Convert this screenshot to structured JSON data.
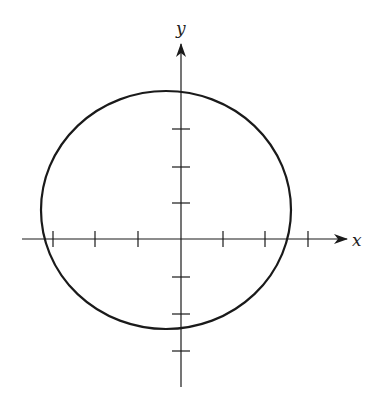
{
  "figure": {
    "type": "ellipse-on-axes",
    "stroke_color": "#1a1a1a",
    "background": "#ffffff"
  },
  "axes": {
    "x_label": "x",
    "y_label": "y",
    "origin_px": [
      181,
      239
    ],
    "x_axis_px": {
      "start": 22,
      "end": 347
    },
    "y_axis_px": {
      "start": 44,
      "end": 387
    },
    "x_ticks_px": [
      53,
      95,
      138,
      223,
      265,
      308
    ],
    "y_ticks_px": [
      129,
      167,
      203,
      277,
      314,
      351
    ],
    "x_ticks_units": [
      -3,
      -2,
      -1,
      1,
      2,
      3
    ],
    "y_ticks_units": [
      3,
      2,
      1,
      -1,
      -2,
      -3
    ],
    "unit_px": {
      "x": 42.5,
      "y": 37
    }
  },
  "ellipse": {
    "center_px": [
      166,
      210
    ],
    "rx_px": 125,
    "ry_px": 119
  }
}
